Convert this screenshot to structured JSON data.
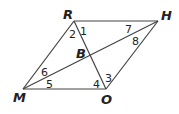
{
  "diagram": {
    "type": "parallelogram with diagonals",
    "vertices": {
      "R": "R",
      "H": "H",
      "M": "M",
      "O": "O",
      "B": "B"
    },
    "angles": {
      "a1": "1",
      "a2": "2",
      "a3": "3",
      "a4": "4",
      "a5": "5",
      "a6": "6",
      "a7": "7",
      "a8": "8"
    },
    "segments": [
      "RH",
      "HO",
      "OM",
      "MR",
      "RO",
      "MH"
    ],
    "stroke_color": "#444444"
  }
}
